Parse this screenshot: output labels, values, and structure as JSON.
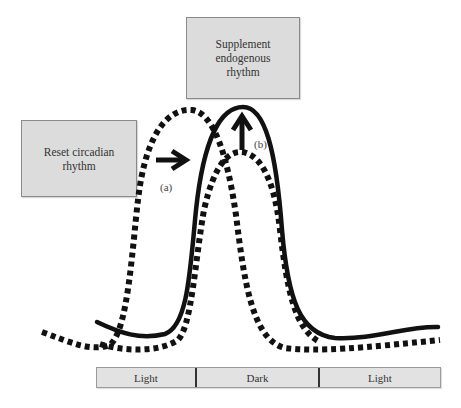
{
  "boxes": {
    "supplement": {
      "line1": "Supplement",
      "line2": "endogenous",
      "line3": "rhythm"
    },
    "reset": {
      "line1": "Reset circadian",
      "line2": "rhythm"
    }
  },
  "labels": {
    "a": "(a)",
    "b": "(b)"
  },
  "period_bar": {
    "segments": [
      {
        "label": "Light"
      },
      {
        "label": "Dark"
      },
      {
        "label": "Light"
      }
    ]
  },
  "curves": {
    "solid": "endogenous rhythm (solid)",
    "dotted_advanced": "phase-advanced rhythm (dotted, left)",
    "dotted_low": "low-amplitude rhythm (dotted, inner)"
  },
  "colors": {
    "box_fill": "#dcdcdc",
    "bar_fill": "#e2e2e2",
    "curve": "#111111"
  }
}
